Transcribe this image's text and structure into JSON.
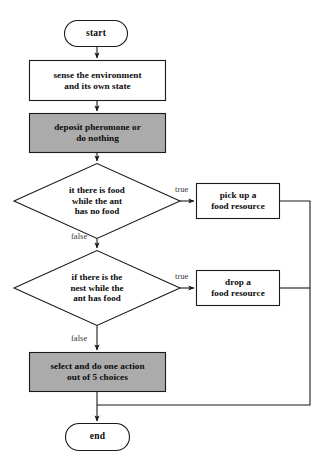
{
  "diagram": {
    "canvas": {
      "width": 325,
      "height": 467,
      "background": "#ffffff"
    },
    "colors": {
      "stroke": "#1a1a1a",
      "fill_plain": "#ffffff",
      "fill_highlight": "#ababab",
      "text": "#0a0a0a",
      "edge_label_text": "#3a3a3a"
    }
  },
  "nodes": {
    "start": {
      "label": "start",
      "shape": "terminator"
    },
    "sense": {
      "label": "sense the environment\nand its own state",
      "shape": "process"
    },
    "deposit": {
      "label": "deposit pheromone or\ndo nothing",
      "shape": "process"
    },
    "decision_food": {
      "label": "it there is food\nwhile the ant\nhas no food",
      "shape": "decision"
    },
    "pick_up": {
      "label": "pick up a\nfood resource",
      "shape": "process"
    },
    "decision_nest": {
      "label": "if there is the\nnest while the\nant has food",
      "shape": "decision"
    },
    "drop": {
      "label": "drop a\nfood resource",
      "shape": "process"
    },
    "select": {
      "label": "select and do one action\nout of 5 choices",
      "shape": "process"
    },
    "end": {
      "label": "end",
      "shape": "terminator"
    }
  },
  "edge_labels": {
    "food_true": "true",
    "food_false": "false",
    "nest_true": "true",
    "nest_false": "false"
  }
}
